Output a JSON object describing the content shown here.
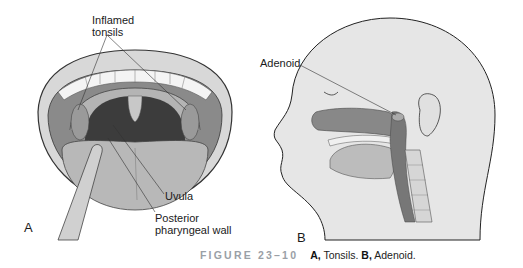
{
  "figure": {
    "number_label": "FIGURE 23–10",
    "caption": {
      "a_letter": "A,",
      "a_text": " Tonsils. ",
      "b_letter": "B,",
      "b_text": " Adenoid."
    },
    "panel_a": {
      "letter": "A",
      "labels": {
        "inflamed_tonsils_1": "Inflamed",
        "inflamed_tonsils_2": "tonsils",
        "uvula": "Uvula",
        "posterior_1": "Posterior",
        "posterior_2": "pharyngeal wall"
      }
    },
    "panel_b": {
      "letter": "B",
      "labels": {
        "adenoid": "Adenoid"
      }
    },
    "colors": {
      "caption_figure_number": "#9aa0a6",
      "skin": "#e6e6e6",
      "tissue_dark": "#7a7a7a",
      "throat": "#3c3c3c",
      "outline": "#333333"
    }
  }
}
